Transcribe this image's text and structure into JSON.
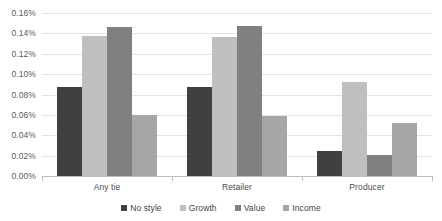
{
  "chart_data": {
    "type": "bar",
    "title": "",
    "xlabel": "",
    "ylabel": "",
    "categories": [
      "Any tie",
      "Retailer",
      "Producer"
    ],
    "series": [
      {
        "name": "No style",
        "color": "#404040",
        "values": [
          0.087,
          0.087,
          0.025
        ]
      },
      {
        "name": "Growth",
        "color": "#bfbfbf",
        "values": [
          0.137,
          0.136,
          0.092
        ]
      },
      {
        "name": "Value",
        "color": "#808080",
        "values": [
          0.146,
          0.147,
          0.021
        ]
      },
      {
        "name": "Income",
        "color": "#a6a6a6",
        "values": [
          0.06,
          0.059,
          0.052
        ]
      }
    ],
    "ylim": [
      0.0,
      0.16
    ],
    "ytick_step": 0.02,
    "ytick_labels": [
      "0.00%",
      "0.02%",
      "0.04%",
      "0.06%",
      "0.08%",
      "0.10%",
      "0.12%",
      "0.14%",
      "0.16%"
    ],
    "ytick_values": [
      0.0,
      0.02,
      0.04,
      0.06,
      0.08,
      0.1,
      0.12,
      0.14,
      0.16
    ],
    "value_suffix": "%",
    "grid": true,
    "grid_color": "#e3e3e3",
    "axis_color": "#bdbdbd",
    "legend_position": "bottom"
  }
}
